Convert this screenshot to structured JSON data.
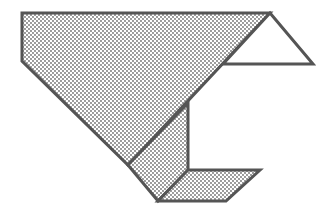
{
  "diagram": {
    "colors": {
      "stroke": "#555555",
      "fill_dots": "#6e6e6e",
      "background": "#ffffff",
      "unshaded": "#ffffff"
    },
    "shapes": [
      {
        "name": "main-shaded-pentagon",
        "shaded": true,
        "points": "22,13 270,13 128,165 22,61"
      },
      {
        "name": "lower-shaded-quad",
        "shaded": true,
        "points": "128,165 188,103 188,170 158,201"
      },
      {
        "name": "bottom-parallelogram",
        "shaded": true,
        "points": "188,170 260,170 226,201 158,201"
      },
      {
        "name": "right-triangle",
        "shaded": false,
        "points": "270,13 313,64 223,64"
      }
    ]
  }
}
